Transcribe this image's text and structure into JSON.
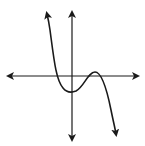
{
  "figure": {
    "function_type": "cubic",
    "leading_coefficient_sign": "negative",
    "end_behavior": {
      "left": "up",
      "right": "down"
    },
    "x_intercepts_count": 3,
    "local_minimum": "below x-axis near y-axis",
    "local_maximum": "slightly above x-axis, right of y-axis",
    "colors": {
      "curve": "#1a1a1a",
      "axes": "#1a1a1a",
      "background": "#ffffff"
    }
  }
}
